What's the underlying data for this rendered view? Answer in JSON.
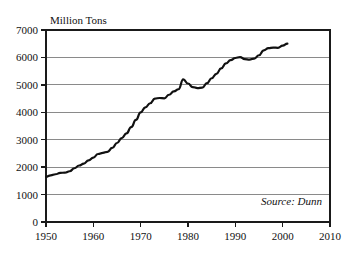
{
  "chart_data": {
    "type": "line",
    "title": "",
    "ylabel": "Million Tons",
    "xlabel": "",
    "xlim": [
      1950,
      2010
    ],
    "ylim": [
      0,
      7000
    ],
    "grid": true,
    "legend_position": "none",
    "annotation": "Source: Dunn",
    "xticks": [
      1950,
      1960,
      1970,
      1980,
      1990,
      2000,
      2010
    ],
    "xtick_labels": [
      "1950",
      "1960",
      "1970",
      "1980",
      "1990",
      "2000",
      "2010"
    ],
    "yticks": [
      0,
      1000,
      2000,
      3000,
      4000,
      5000,
      6000,
      7000
    ],
    "ytick_labels": [
      "0",
      "1000",
      "2000",
      "3000",
      "4000",
      "5000",
      "6000",
      "7000"
    ],
    "line_color": "#111111",
    "grid_color": "#8a8a8a",
    "series": [
      {
        "name": "Million Tons",
        "x": [
          1950,
          1951,
          1952,
          1953,
          1954,
          1955,
          1956,
          1957,
          1958,
          1959,
          1960,
          1961,
          1962,
          1963,
          1964,
          1965,
          1966,
          1967,
          1968,
          1969,
          1970,
          1971,
          1972,
          1973,
          1974,
          1975,
          1976,
          1977,
          1978,
          1979,
          1980,
          1981,
          1982,
          1983,
          1984,
          1985,
          1986,
          1987,
          1988,
          1989,
          1990,
          1991,
          1992,
          1993,
          1994,
          1995,
          1996,
          1997,
          1998,
          1999,
          2000,
          2001
        ],
        "values": [
          1650,
          1700,
          1740,
          1790,
          1800,
          1850,
          1960,
          2060,
          2130,
          2250,
          2350,
          2480,
          2520,
          2560,
          2700,
          2880,
          3060,
          3230,
          3460,
          3720,
          4000,
          4180,
          4330,
          4500,
          4520,
          4510,
          4640,
          4760,
          4840,
          5200,
          5050,
          4920,
          4880,
          4900,
          5060,
          5240,
          5400,
          5600,
          5780,
          5900,
          5980,
          6010,
          5940,
          5920,
          5960,
          6080,
          6260,
          6340,
          6360,
          6350,
          6430,
          6500
        ]
      }
    ]
  }
}
